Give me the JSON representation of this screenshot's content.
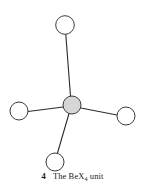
{
  "figure": {
    "caption_number": "4",
    "caption_text_before": "The BeX",
    "caption_subscript": "4",
    "caption_text_after": " unit",
    "caption_full": "4 The BeX4 unit"
  },
  "diagram": {
    "type": "chemical-structure",
    "title": "BeX4 unit",
    "background_color": "#ffffff",
    "bond_color": "#2b2b2b",
    "bond_width": 1.1,
    "atom_outline_color": "#3a3a3a",
    "atom_outline_width": 1.0,
    "ligand_fill_color": "#ffffff",
    "center_fill_color": "#d6d6d6",
    "center_atom": {
      "label": "Be",
      "cx": 72,
      "cy": 105,
      "r": 9,
      "shaded": "true"
    },
    "ligand_atoms": [
      {
        "label": "X",
        "position": "top",
        "cx": 65,
        "cy": 25,
        "r": 9.3
      },
      {
        "label": "X",
        "position": "left",
        "cx": 19,
        "cy": 111,
        "r": 9.0
      },
      {
        "label": "X",
        "position": "right",
        "cx": 126,
        "cy": 116,
        "r": 9.0
      },
      {
        "label": "X",
        "position": "bottom",
        "cx": 55,
        "cy": 162,
        "r": 9.0
      }
    ],
    "bonds": [
      {
        "from": "center",
        "to": "top",
        "x1": 70.5,
        "y1": 96,
        "x2": 65.8,
        "y2": 34.5
      },
      {
        "from": "center",
        "to": "left",
        "x1": 63.2,
        "y1": 107,
        "x2": 28.0,
        "y2": 111.5
      },
      {
        "from": "center",
        "to": "right",
        "x1": 80.8,
        "y1": 108,
        "x2": 117.0,
        "y2": 115.0
      },
      {
        "from": "center",
        "to": "bottom",
        "x1": 69.0,
        "y1": 113.5,
        "x2": 57.5,
        "y2": 153.0
      }
    ]
  }
}
